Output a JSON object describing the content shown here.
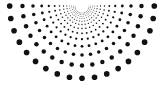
{
  "figure": {
    "name": "radial-dot-sunburst",
    "canvas": {
      "width": 165,
      "height": 90,
      "background_color": "#ffffff"
    }
  },
  "chart_data": {
    "type": "scatter",
    "subtitle": "",
    "xlabel": "",
    "ylabel": "",
    "xlim": [
      0,
      165
    ],
    "ylim": [
      0,
      90
    ],
    "grid": false,
    "legend": null,
    "annotations": [],
    "tick_labels": {
      "x": [],
      "y": []
    },
    "marker": {
      "shape": "circle",
      "color": "#111111",
      "min_radius": 0.35,
      "max_radius": 3.0,
      "radius_model": "radius grows linearly with distance from apex"
    },
    "geometry": {
      "pattern": "half-sunburst fan of dotted rays",
      "apex_x": 82,
      "apex_y": 6,
      "ray_count": 19,
      "dots_per_ray": 13,
      "angle_start_deg": 0,
      "angle_end_deg": 180,
      "angle_step_deg": 10,
      "angle_reference": "0 deg points left along +x toward x=17; 180 deg points right toward x=150; 90 deg points straight down",
      "radius_first": 7,
      "radius_last": 76,
      "radius_growth": "geometric, ratio about 1.215",
      "extent_left_x": 17,
      "extent_right_x": 150,
      "extent_bottom_y": 80
    },
    "series": [
      {
        "name": "ray-00",
        "angle_deg": 0,
        "radii": [
          7,
          8.5,
          10.3,
          12.5,
          15.2,
          18.5,
          22.5,
          27.3,
          33.2,
          40.3,
          49,
          59.5,
          72.3
        ]
      },
      {
        "name": "ray-01",
        "angle_deg": 10,
        "radii": [
          7,
          8.5,
          10.3,
          12.5,
          15.2,
          18.5,
          22.5,
          27.3,
          33.2,
          40.3,
          49,
          59.5,
          72.3
        ]
      },
      {
        "name": "ray-02",
        "angle_deg": 20,
        "radii": [
          7,
          8.5,
          10.3,
          12.5,
          15.2,
          18.5,
          22.5,
          27.3,
          33.2,
          40.3,
          49,
          59.5,
          72.3
        ]
      },
      {
        "name": "ray-03",
        "angle_deg": 30,
        "radii": [
          7,
          8.5,
          10.3,
          12.5,
          15.2,
          18.5,
          22.5,
          27.3,
          33.2,
          40.3,
          49,
          59.5,
          72.3
        ]
      },
      {
        "name": "ray-04",
        "angle_deg": 40,
        "radii": [
          7,
          8.5,
          10.3,
          12.5,
          15.2,
          18.5,
          22.5,
          27.3,
          33.2,
          40.3,
          49,
          59.5,
          72.3
        ]
      },
      {
        "name": "ray-05",
        "angle_deg": 50,
        "radii": [
          7,
          8.5,
          10.3,
          12.5,
          15.2,
          18.5,
          22.5,
          27.3,
          33.2,
          40.3,
          49,
          59.5,
          72.3
        ]
      },
      {
        "name": "ray-06",
        "angle_deg": 60,
        "radii": [
          7,
          8.5,
          10.3,
          12.5,
          15.2,
          18.5,
          22.5,
          27.3,
          33.2,
          40.3,
          49,
          59.5,
          72.3
        ]
      },
      {
        "name": "ray-07",
        "angle_deg": 70,
        "radii": [
          7,
          8.5,
          10.3,
          12.5,
          15.2,
          18.5,
          22.5,
          27.3,
          33.2,
          40.3,
          49,
          59.5,
          72.3
        ]
      },
      {
        "name": "ray-08",
        "angle_deg": 80,
        "radii": [
          7,
          8.5,
          10.3,
          12.5,
          15.2,
          18.5,
          22.5,
          27.3,
          33.2,
          40.3,
          49,
          59.5,
          72.3
        ]
      },
      {
        "name": "ray-09",
        "angle_deg": 90,
        "radii": [
          7,
          8.5,
          10.3,
          12.5,
          15.2,
          18.5,
          22.5,
          27.3,
          33.2,
          40.3,
          49,
          59.5,
          72.3
        ]
      },
      {
        "name": "ray-10",
        "angle_deg": 100,
        "radii": [
          7,
          8.5,
          10.3,
          12.5,
          15.2,
          18.5,
          22.5,
          27.3,
          33.2,
          40.3,
          49,
          59.5,
          72.3
        ]
      },
      {
        "name": "ray-11",
        "angle_deg": 110,
        "radii": [
          7,
          8.5,
          10.3,
          12.5,
          15.2,
          18.5,
          22.5,
          27.3,
          33.2,
          40.3,
          49,
          59.5,
          72.3
        ]
      },
      {
        "name": "ray-12",
        "angle_deg": 120,
        "radii": [
          7,
          8.5,
          10.3,
          12.5,
          15.2,
          18.5,
          22.5,
          27.3,
          33.2,
          40.3,
          49,
          59.5,
          72.3
        ]
      },
      {
        "name": "ray-13",
        "angle_deg": 130,
        "radii": [
          7,
          8.5,
          10.3,
          12.5,
          15.2,
          18.5,
          22.5,
          27.3,
          33.2,
          40.3,
          49,
          59.5,
          72.3
        ]
      },
      {
        "name": "ray-14",
        "angle_deg": 140,
        "radii": [
          7,
          8.5,
          10.3,
          12.5,
          15.2,
          18.5,
          22.5,
          27.3,
          33.2,
          40.3,
          49,
          59.5,
          72.3
        ]
      },
      {
        "name": "ray-15",
        "angle_deg": 150,
        "radii": [
          7,
          8.5,
          10.3,
          12.5,
          15.2,
          18.5,
          22.5,
          27.3,
          33.2,
          40.3,
          49,
          59.5,
          72.3
        ]
      },
      {
        "name": "ray-16",
        "angle_deg": 160,
        "radii": [
          7,
          8.5,
          10.3,
          12.5,
          15.2,
          18.5,
          22.5,
          27.3,
          33.2,
          40.3,
          49,
          59.5,
          72.3
        ]
      },
      {
        "name": "ray-17",
        "angle_deg": 170,
        "radii": [
          7,
          8.5,
          10.3,
          12.5,
          15.2,
          18.5,
          22.5,
          27.3,
          33.2,
          40.3,
          49,
          59.5,
          72.3
        ]
      },
      {
        "name": "ray-18",
        "angle_deg": 180,
        "radii": [
          7,
          8.5,
          10.3,
          12.5,
          15.2,
          18.5,
          22.5,
          27.3,
          33.2,
          40.3,
          49,
          59.5,
          72.3
        ]
      }
    ]
  }
}
